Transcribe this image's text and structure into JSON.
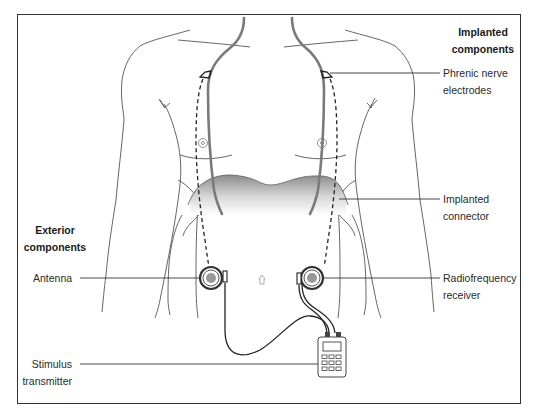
{
  "diagram": {
    "type": "anatomical-schematic",
    "colors": {
      "outline": "#555555",
      "nerve": "#7a7a7a",
      "frame": "#333333",
      "diaphragm_gradient_top": "#8c8c8c",
      "diaphragm_gradient_bottom": "#ffffff"
    }
  },
  "groups": {
    "implanted": {
      "title_line1": "Implanted",
      "title_line2": "components"
    },
    "exterior": {
      "title_line1": "Exterior",
      "title_line2": "components"
    }
  },
  "labels": {
    "phrenic_electrodes": {
      "line1": "Phrenic nerve",
      "line2": "electrodes"
    },
    "implanted_connector": {
      "line1": "Implanted",
      "line2": "connector"
    },
    "radiofrequency_receiver": {
      "line1": "Radiofrequency",
      "line2": "receiver"
    },
    "antenna": {
      "line1": "Antenna"
    },
    "stimulus_transmitter": {
      "line1": "Stimulus",
      "line2": "transmitter"
    }
  }
}
